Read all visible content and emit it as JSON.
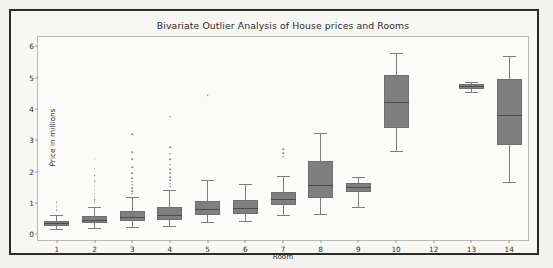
{
  "chart_data": {
    "type": "box",
    "title": "Bivariate Outlier Analysis of House prices and Rooms",
    "xlabel": "Room",
    "ylabel": "Price in millions",
    "categories": [
      "1",
      "2",
      "3",
      "4",
      "5",
      "6",
      "7",
      "8",
      "9",
      "10",
      "12",
      "13",
      "14"
    ],
    "xlim": [
      0.5,
      13.5
    ],
    "ylim": [
      -0.18,
      6.3
    ],
    "yticks": [
      0,
      1,
      2,
      3,
      4,
      5,
      6
    ],
    "grid": false,
    "legend": null,
    "box_color": "#807f7f",
    "median_color": "#4d4c4c",
    "whisker_color": "#7e7d7d",
    "flier_color": "#8f8e8e",
    "boxes": [
      {
        "label": "1",
        "whisker_low": 0.18,
        "q1": 0.28,
        "median": 0.35,
        "q3": 0.44,
        "whisker_high": 0.62,
        "fliers": [
          0.78,
          0.85,
          0.92,
          1.02
        ]
      },
      {
        "label": "2",
        "whisker_low": 0.2,
        "q1": 0.36,
        "median": 0.47,
        "q3": 0.58,
        "whisker_high": 0.88,
        "fliers": [
          0.98,
          1.05,
          1.12,
          1.2,
          1.3,
          1.42,
          1.55,
          1.7,
          1.88,
          2.1,
          2.42
        ]
      },
      {
        "label": "3",
        "whisker_low": 0.24,
        "q1": 0.42,
        "median": 0.56,
        "q3": 0.75,
        "whisker_high": 1.18,
        "fliers": [
          1.3,
          1.38,
          1.48,
          1.58,
          1.68,
          1.8,
          1.95,
          2.15,
          2.4,
          2.62,
          3.2
        ]
      },
      {
        "label": "4",
        "whisker_low": 0.26,
        "q1": 0.46,
        "median": 0.62,
        "q3": 0.86,
        "whisker_high": 1.42,
        "fliers": [
          1.52,
          1.62,
          1.72,
          1.82,
          1.95,
          2.08,
          2.22,
          2.4,
          2.58,
          2.78,
          3.75
        ]
      },
      {
        "label": "5",
        "whisker_low": 0.4,
        "q1": 0.62,
        "median": 0.82,
        "q3": 1.05,
        "whisker_high": 1.72,
        "fliers": [
          4.45
        ]
      },
      {
        "label": "6",
        "whisker_low": 0.42,
        "q1": 0.64,
        "median": 0.85,
        "q3": 1.1,
        "whisker_high": 1.62,
        "fliers": []
      },
      {
        "label": "7",
        "whisker_low": 0.62,
        "q1": 0.95,
        "median": 1.12,
        "q3": 1.35,
        "whisker_high": 1.86,
        "fliers": [
          2.48,
          2.6,
          2.72
        ]
      },
      {
        "label": "8",
        "whisker_low": 0.66,
        "q1": 1.15,
        "median": 1.58,
        "q3": 2.35,
        "whisker_high": 3.22,
        "fliers": []
      },
      {
        "label": "9",
        "whisker_low": 0.88,
        "q1": 1.35,
        "median": 1.52,
        "q3": 1.65,
        "whisker_high": 1.82,
        "fliers": []
      },
      {
        "label": "10",
        "whisker_low": 2.65,
        "q1": 3.4,
        "median": 4.22,
        "q3": 5.1,
        "whisker_high": 5.8,
        "fliers": []
      },
      {
        "label": "12",
        "whisker_low": null,
        "q1": null,
        "median": null,
        "q3": null,
        "whisker_high": null,
        "fliers": []
      },
      {
        "label": "13",
        "whisker_low": 4.56,
        "q1": 4.64,
        "median": 4.72,
        "q3": 4.79,
        "whisker_high": 4.86,
        "fliers": []
      },
      {
        "label": "14",
        "whisker_low": 1.68,
        "q1": 2.86,
        "median": 3.82,
        "q3": 4.95,
        "whisker_high": 5.68,
        "fliers": []
      }
    ]
  }
}
